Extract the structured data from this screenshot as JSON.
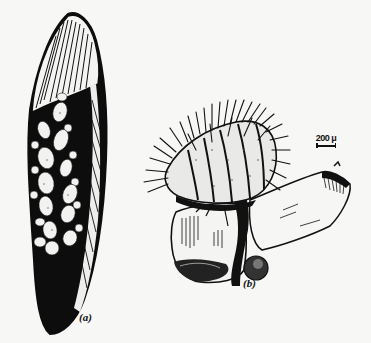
{
  "figure": {
    "panels": [
      {
        "id": "a",
        "label": "(a)",
        "subject": "leaf-with-egg-cluster"
      },
      {
        "id": "b",
        "label": "(b)",
        "subject": "spiny-larva-hatching-from-egg"
      }
    ],
    "scale_bar": {
      "text": "200 μ"
    },
    "colors": {
      "ink": "#111111",
      "paper": "#f7f7f5"
    }
  }
}
